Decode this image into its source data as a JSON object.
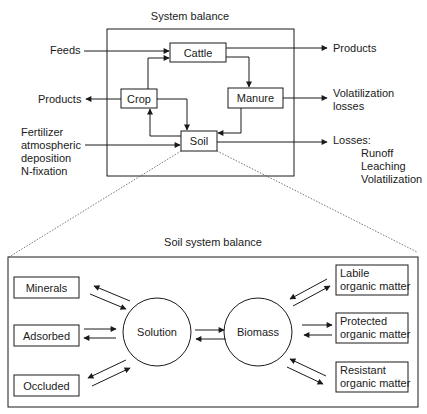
{
  "top": {
    "title": "System balance",
    "nodes": {
      "cattle": "Cattle",
      "crop": "Crop",
      "manure": "Manure",
      "soil": "Soil"
    },
    "inputs": {
      "feeds": "Feeds",
      "fertilizer_lines": [
        "Fertilizer",
        "atmospheric",
        "deposition",
        "N-fixation"
      ]
    },
    "outputs": {
      "products_left": "Products",
      "products_right": "Products",
      "volatilization_lines": [
        "Volatilization",
        "losses"
      ],
      "losses_title": "Losses:",
      "losses_items": [
        "Runoff",
        "Leaching",
        "Volatilization"
      ]
    }
  },
  "bottom": {
    "title": "Soil system balance",
    "left_pools": [
      "Minerals",
      "Adsorbed",
      "Occluded"
    ],
    "circles": {
      "solution": "Solution",
      "biomass": "Biomass"
    },
    "right_pools": [
      [
        "Labile",
        "organic matter"
      ],
      [
        "Protected",
        "organic matter"
      ],
      [
        "Resistant",
        "organic matter"
      ]
    ]
  },
  "colors": {
    "stroke": "#1a1a1a",
    "background": "#ffffff"
  }
}
